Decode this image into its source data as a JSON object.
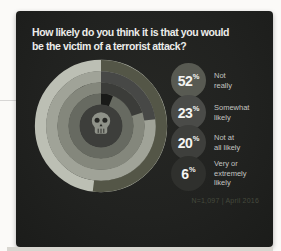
{
  "card": {
    "title": "How likely do you think it is that you would\nbe the victim of a terrorist attack?",
    "footnote": "N=1,097 | April 2016"
  },
  "legend": {
    "items": [
      {
        "value": "52",
        "unit": "%",
        "label": "Not\nreally",
        "color": "#585a52"
      },
      {
        "value": "23",
        "unit": "%",
        "label": "Somewhat\nlikely",
        "color": "#4a4b48"
      },
      {
        "value": "20",
        "unit": "%",
        "label": "Not at\nall likely",
        "color": "#3e3f3c"
      },
      {
        "value": "6",
        "unit": "%",
        "label": "Very or\nextremely\nlikely",
        "color": "#2f302d"
      }
    ]
  },
  "chart_data": {
    "type": "radial-bar",
    "title": "How likely do you think it is that you would be the victim of a terrorist attack?",
    "categories": [
      "Not really",
      "Somewhat likely",
      "Not at all likely",
      "Very or extremely likely"
    ],
    "values": [
      52,
      23,
      20,
      6
    ],
    "unit": "%",
    "start_angle_deg": 0,
    "direction": "clockwise",
    "ring_order": "outer-to-inner",
    "rings": [
      {
        "category": "Not really",
        "value": 52,
        "fill": "#545647",
        "track": "#bcbfb4"
      },
      {
        "category": "Somewhat likely",
        "value": 23,
        "fill": "#474846",
        "track": "#a0a398"
      },
      {
        "category": "Not at all likely",
        "value": 20,
        "fill": "#3b3c39",
        "track": "#84877c"
      },
      {
        "category": "Very or extremely likely",
        "value": 6,
        "fill": "#191a18",
        "track": "#676a61"
      }
    ],
    "center_color": "#3d3e3b",
    "center_icon": "skull",
    "footnote": "N=1,097 | April 2016"
  }
}
